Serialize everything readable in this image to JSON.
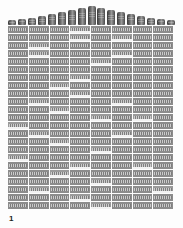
{
  "page": {
    "page_number": "1",
    "colors": {
      "cell": "#8c8c8c",
      "highlight_band": "#f2f2f2",
      "background": "#fdfdfd"
    }
  },
  "banner": {
    "description": "row of cylindrical product images arranged in an arch",
    "items": [
      {
        "h": 5
      },
      {
        "h": 6
      },
      {
        "h": 7
      },
      {
        "h": 9
      },
      {
        "h": 11
      },
      {
        "h": 13
      },
      {
        "h": 15
      },
      {
        "h": 17
      },
      {
        "h": 19
      },
      {
        "h": 17
      },
      {
        "h": 15
      },
      {
        "h": 13
      },
      {
        "h": 11
      },
      {
        "h": 9
      },
      {
        "h": 7
      },
      {
        "h": 6
      },
      {
        "h": 5
      }
    ]
  },
  "grid": {
    "columns": 8,
    "rows": 23,
    "note": "cell text illegible at this resolution",
    "highlighted": [
      [
        0,
        3
      ],
      [
        1,
        3
      ],
      [
        1,
        5
      ],
      [
        2,
        1
      ],
      [
        3,
        1
      ],
      [
        3,
        5
      ],
      [
        4,
        4
      ],
      [
        6,
        3
      ],
      [
        7,
        2
      ],
      [
        8,
        3
      ],
      [
        9,
        1
      ],
      [
        9,
        5
      ],
      [
        10,
        2
      ],
      [
        11,
        4
      ],
      [
        11,
        6
      ],
      [
        12,
        0
      ],
      [
        13,
        1
      ],
      [
        13,
        5
      ],
      [
        14,
        2
      ],
      [
        15,
        4
      ],
      [
        16,
        0
      ],
      [
        17,
        3
      ],
      [
        17,
        6
      ],
      [
        18,
        2
      ],
      [
        19,
        4
      ],
      [
        20,
        1
      ],
      [
        20,
        7
      ],
      [
        21,
        3
      ],
      [
        22,
        4
      ]
    ]
  }
}
